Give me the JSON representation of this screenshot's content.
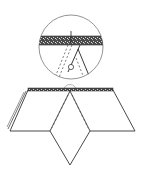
{
  "diagram": {
    "colors": {
      "line": "#333333",
      "band": "#555555",
      "background": "#ffffff"
    },
    "detail_circle": {
      "cx": 71,
      "cy": 47,
      "r": 32
    },
    "small_circle": {
      "cx": 70,
      "cy": 91,
      "r": 6
    },
    "spine": {
      "x1": 28,
      "x2": 113,
      "y": 89,
      "thickness": 3
    },
    "left_panel": [
      [
        28,
        90
      ],
      [
        10,
        131
      ],
      [
        50,
        131
      ]
    ],
    "right_panel": [
      [
        113,
        90
      ],
      [
        135,
        131
      ],
      [
        90,
        131
      ]
    ],
    "center_diamond": [
      [
        70,
        91
      ],
      [
        50,
        131
      ],
      [
        70,
        165
      ],
      [
        90,
        131
      ]
    ]
  }
}
